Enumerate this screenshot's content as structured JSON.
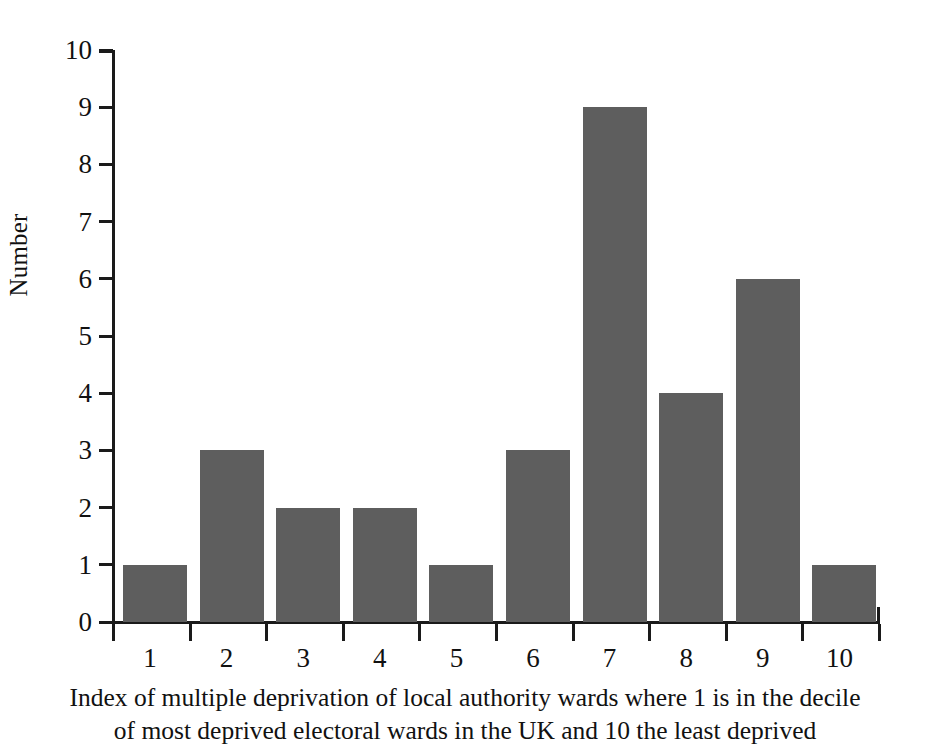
{
  "chart_data": {
    "type": "bar",
    "title": "",
    "subtitle": "",
    "categories": [
      "1",
      "2",
      "3",
      "4",
      "5",
      "6",
      "7",
      "8",
      "9",
      "10"
    ],
    "values": [
      1,
      3,
      2,
      2,
      1,
      3,
      9,
      4,
      6,
      1
    ],
    "xlabel": "Index of multiple deprivation of local authority wards where 1 is in the decile of most deprived electoral wards in the UK and 10 the least deprived",
    "xlabel_lines": [
      "Index of multiple deprivation of local authority wards where 1 is in the decile",
      "of most deprived electoral wards in the UK and 10 the least deprived"
    ],
    "ylabel": "Number",
    "ylim": [
      0,
      10
    ],
    "ytick_labels": [
      "0",
      "1",
      "2",
      "3",
      "4",
      "5",
      "6",
      "7",
      "8",
      "9",
      "10"
    ],
    "ytick_values": [
      0,
      1,
      2,
      3,
      4,
      5,
      6,
      7,
      8,
      9,
      10
    ],
    "grid": false,
    "legend": false,
    "legend_position": "none",
    "bar_color": "#5e5e5e",
    "axis_color": "#1a1a1a",
    "background_color": "#ffffff"
  }
}
